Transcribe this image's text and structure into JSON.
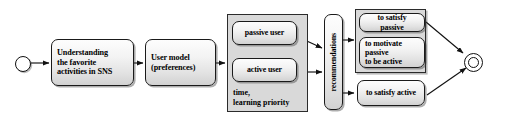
{
  "diagram": {
    "background_color": "#ffffff",
    "group_fill_color": "#d9d9d9",
    "box_border_color": "#1a1a1a",
    "nodes": {
      "start": {
        "name": "start-node",
        "shape": "circle"
      },
      "step1": {
        "label": "Understanding\nthe favorite\nactivities in SNS",
        "line1": "Understanding",
        "line2": "the favorite",
        "line3": "activities in SNS"
      },
      "step2": {
        "label": "User model\n(preferences)",
        "line1": "User model",
        "line2": "(preferences)"
      },
      "user_group": {
        "passive": "passive user",
        "active": "active user",
        "note_line1": "time,",
        "note_line2": "learning priority"
      },
      "recommendations": {
        "label": "recommendations",
        "orientation": "vertical"
      },
      "passive_goals_group": {
        "satisfy_passive": "to satisfy passive",
        "motivate_line1": "to motivate passive",
        "motivate_line2": "to be active"
      },
      "satisfy_active": {
        "label": "to satisfy active"
      },
      "end": {
        "name": "end-node",
        "shape": "circle-in-circle"
      }
    },
    "edges": [
      {
        "from": "start",
        "to": "step1"
      },
      {
        "from": "step1",
        "to": "step2"
      },
      {
        "from": "step2",
        "to": "user_group"
      },
      {
        "from": "passive_user",
        "to": "recommendations"
      },
      {
        "from": "active_user",
        "to": "recommendations"
      },
      {
        "from": "recommendations",
        "to": "passive_goals_group"
      },
      {
        "from": "recommendations",
        "to": "satisfy_active"
      },
      {
        "from": "passive_goals_group",
        "to": "end"
      },
      {
        "from": "satisfy_active",
        "to": "end"
      }
    ]
  }
}
